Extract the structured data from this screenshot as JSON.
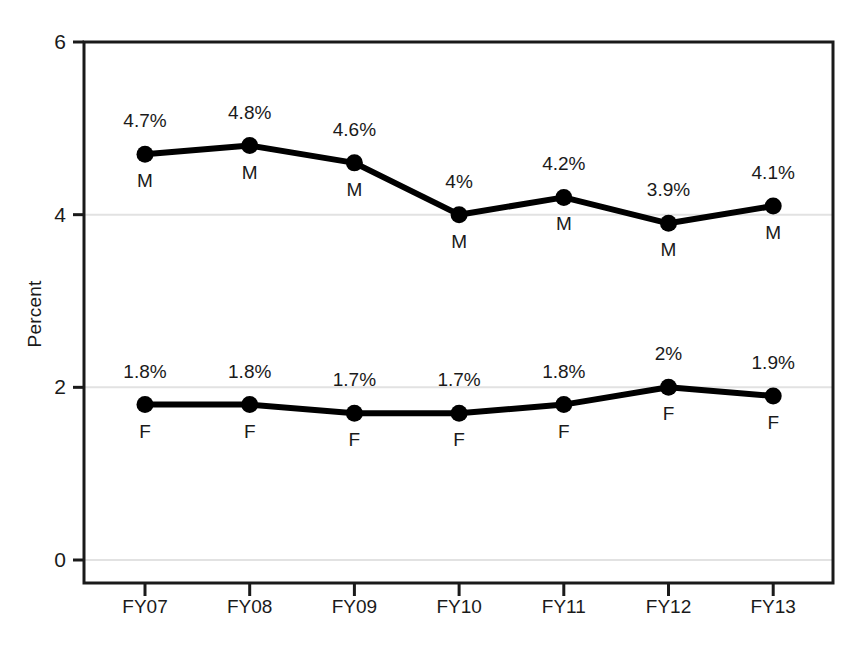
{
  "chart_data": {
    "type": "line",
    "title": "",
    "subtitle": "",
    "xlabel": "",
    "ylabel": "Percent",
    "categories": [
      "FY07",
      "FY08",
      "FY09",
      "FY10",
      "FY11",
      "FY12",
      "FY13"
    ],
    "ylim": [
      0,
      6
    ],
    "yticks": [
      0,
      2,
      4,
      6
    ],
    "ytick_labels": [
      "0",
      "2",
      "4",
      "6"
    ],
    "grid": true,
    "grid_axis": "y",
    "legend": "none",
    "point_labels_position": "above",
    "series_letter_position": "below",
    "series": [
      {
        "name": "M",
        "letter": "M",
        "values": [
          4.7,
          4.8,
          4.6,
          4.0,
          4.2,
          3.9,
          4.1
        ],
        "data_labels": [
          "4.7%",
          "4.8%",
          "4.6%",
          "4%",
          "4.2%",
          "3.9%",
          "4.1%"
        ],
        "color": "#000000"
      },
      {
        "name": "F",
        "letter": "F",
        "values": [
          1.8,
          1.8,
          1.7,
          1.7,
          1.8,
          2.0,
          1.9
        ],
        "data_labels": [
          "1.8%",
          "1.8%",
          "1.7%",
          "1.7%",
          "1.8%",
          "2%",
          "1.9%"
        ],
        "color": "#000000"
      }
    ]
  },
  "style": {
    "background": "#ffffff",
    "frame_color": "#1a1a1a",
    "grid_color": "#e2e2e2",
    "line_color": "#000000",
    "marker_color": "#000000",
    "text_color": "#1a1a1a"
  }
}
